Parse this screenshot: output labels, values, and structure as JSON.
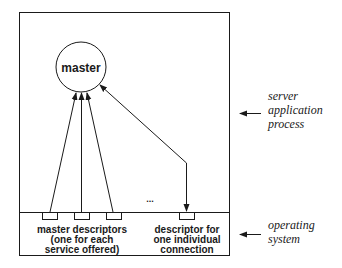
{
  "diagram": {
    "type": "server-process-descriptors",
    "master_node": {
      "label": "master"
    },
    "dots": "...",
    "master_descriptors_label": [
      "master descriptors",
      "(one for each",
      "service offered)"
    ],
    "individual_descriptor_label": [
      "descriptor for",
      "one individual",
      "connection"
    ],
    "side_labels": {
      "server": [
        "server",
        "application",
        "process"
      ],
      "os": [
        "operating",
        "system"
      ]
    },
    "colors": {
      "stroke": "#1a1a1a",
      "background": "#ffffff"
    }
  }
}
